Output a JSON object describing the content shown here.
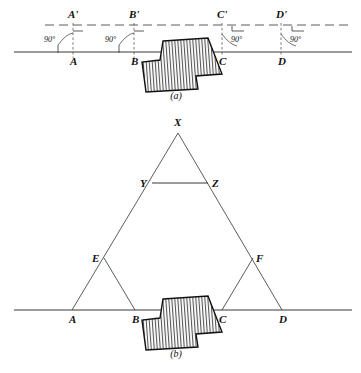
{
  "figure": {
    "panels": [
      {
        "caption": "(a)",
        "caption_pos": {
          "x": 176,
          "y": 99
        },
        "baseline": {
          "x1": 14,
          "y1": 52,
          "x2": 352,
          "y2": 52
        },
        "top_dashed_line": {
          "x1": 45,
          "y1": 25,
          "x2": 352,
          "y2": 25
        },
        "points": [
          {
            "name": "A",
            "x": 73,
            "y": 52,
            "label": "A",
            "label_x": 70,
            "label_y": 65
          },
          {
            "name": "B",
            "x": 134,
            "y": 52,
            "label": "B",
            "label_x": 131,
            "label_y": 65
          },
          {
            "name": "C",
            "x": 222,
            "y": 52,
            "label": "C",
            "label_x": 219,
            "label_y": 65
          },
          {
            "name": "D",
            "x": 281,
            "y": 52,
            "label": "D",
            "label_x": 278,
            "label_y": 65
          }
        ],
        "top_points": [
          {
            "name": "Aprime",
            "label": "A'",
            "x": 73,
            "y": 25,
            "label_x": 68,
            "label_y": 18
          },
          {
            "name": "Bprime",
            "label": "B'",
            "x": 134,
            "y": 25,
            "label_x": 129,
            "label_y": 18
          },
          {
            "name": "Cprime",
            "label": "C'",
            "x": 222,
            "y": 25,
            "label_x": 217,
            "label_y": 18
          },
          {
            "name": "Dprime",
            "label": "D'",
            "x": 281,
            "y": 25,
            "label_x": 276,
            "label_y": 18
          }
        ],
        "angles": [
          {
            "name": "angle-at-A",
            "value": "90°",
            "label_x": 44,
            "label_y": 42,
            "side": "left"
          },
          {
            "name": "angle-at-B",
            "value": "90°",
            "label_x": 105,
            "label_y": 42,
            "side": "left"
          },
          {
            "name": "angle-at-C",
            "value": "90°",
            "label_x": 231,
            "label_y": 42,
            "side": "right"
          },
          {
            "name": "angle-at-D",
            "value": "90°",
            "label_x": 290,
            "label_y": 42,
            "side": "right"
          }
        ],
        "building_points": "163,41 208,38 222,74 196,76 198,89 146,92 142,62 160,60",
        "building_note": "L-shaped hatched building plan straddling the survey line between B and C"
      },
      {
        "caption": "(b)",
        "caption_pos": {
          "x": 176,
          "y": 357
        },
        "baseline": {
          "x1": 14,
          "y1": 310,
          "x2": 352,
          "y2": 310
        },
        "points": [
          {
            "name": "A",
            "x": 72,
            "y": 310,
            "label": "A",
            "label_x": 69,
            "label_y": 323
          },
          {
            "name": "B",
            "x": 135,
            "y": 310,
            "label": "B",
            "label_x": 132,
            "label_y": 323
          },
          {
            "name": "C",
            "x": 222,
            "y": 310,
            "label": "C",
            "label_x": 219,
            "label_y": 323
          },
          {
            "name": "D",
            "x": 282,
            "y": 310,
            "label": "D",
            "label_x": 279,
            "label_y": 323
          },
          {
            "name": "X",
            "x": 178,
            "y": 133,
            "label": "X",
            "label_x": 174,
            "label_y": 126
          },
          {
            "name": "Y",
            "x": 152,
            "y": 183,
            "label": "Y",
            "label_x": 140,
            "label_y": 187
          },
          {
            "name": "Z",
            "x": 208,
            "y": 183,
            "label": "Z",
            "label_x": 212,
            "label_y": 187
          },
          {
            "name": "E",
            "x": 104,
            "y": 258,
            "label": "E",
            "label_x": 92,
            "label_y": 262
          },
          {
            "name": "F",
            "x": 253,
            "y": 258,
            "label": "F",
            "label_x": 256,
            "label_y": 262
          }
        ],
        "segments": [
          {
            "name": "segment-A-X",
            "x1": 72,
            "y1": 310,
            "x2": 178,
            "y2": 133
          },
          {
            "name": "segment-D-X",
            "x1": 282,
            "y1": 310,
            "x2": 178,
            "y2": 133
          },
          {
            "name": "segment-Y-Z",
            "x1": 152,
            "y1": 183,
            "x2": 208,
            "y2": 183
          },
          {
            "name": "segment-E-B",
            "x1": 104,
            "y1": 258,
            "x2": 135,
            "y2": 310
          },
          {
            "name": "segment-F-C",
            "x1": 253,
            "y1": 258,
            "x2": 222,
            "y2": 310
          }
        ],
        "building_points": "163,299 208,296 222,332 196,334 198,347 146,350 142,320 160,318",
        "building_note": "Same hatched building plan shown with triangulation network"
      }
    ]
  },
  "colors": {
    "ink": "#222222",
    "line": "#333333",
    "background": "#ffffff",
    "hatch": "#444444"
  },
  "icons": {
    "hatch_pattern": "diagonal-hatch-pattern"
  }
}
